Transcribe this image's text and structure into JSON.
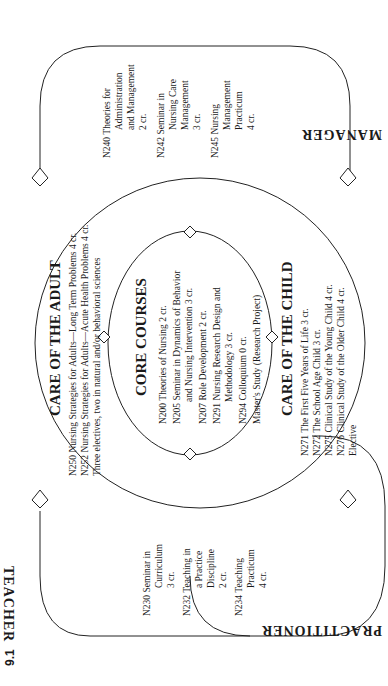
{
  "figure_label": "9.1",
  "roles": {
    "manager": "MANAGER",
    "teacher": "TEACHER",
    "practitioner": "PRACTITIONER"
  },
  "core_courses": {
    "title": "CORE COURSES",
    "items": [
      {
        "code": "N200",
        "lines": [
          "Theories of Nursing 2 cr."
        ]
      },
      {
        "code": "N205",
        "lines": [
          "Seminar in Dynamics of Behavior",
          "and Nursing Intervention 3 cr."
        ]
      },
      {
        "code": "N207",
        "lines": [
          "Role Development 2 cr."
        ]
      },
      {
        "code": "N291",
        "lines": [
          "Nursing Research Design and",
          "Methodology 3 cr."
        ]
      },
      {
        "code": "N294",
        "lines": [
          "Colloquium 0 cr."
        ]
      },
      {
        "code": "",
        "lines": [
          "Master's Study (Research Project)"
        ]
      }
    ]
  },
  "care_of_adult": {
    "title": "CARE OF THE ADULT",
    "items": [
      {
        "code": "N250",
        "lines": [
          "Nursing Strategies for Adults—Long Term Problems 4 cr."
        ]
      },
      {
        "code": "N252",
        "lines": [
          "Nursing Strategies for Adults—Acute Health Problems 4 cr."
        ]
      },
      {
        "code": "",
        "lines": [
          "Three electives, two in natural and/or behavioral sciences"
        ]
      }
    ]
  },
  "care_of_child": {
    "title": "CARE OF THE CHILD",
    "items": [
      {
        "code": "N271",
        "lines": [
          "The First Five Years of Life 3 cr."
        ]
      },
      {
        "code": "N272",
        "lines": [
          "The School Age Child 3 cr."
        ]
      },
      {
        "code": "N275",
        "lines": [
          "Clinical Study of the Young Child 4 cr."
        ]
      },
      {
        "code": "N276",
        "lines": [
          "Clinical Study of the Older Child 4 cr."
        ]
      },
      {
        "code": "",
        "lines": [
          "Elective"
        ]
      }
    ]
  },
  "manager_track": {
    "items": [
      {
        "code": "N240",
        "lines": [
          "Theories for",
          "Administration",
          "and Management",
          "2 cr."
        ]
      },
      {
        "code": "N242",
        "lines": [
          "Seminar in",
          "Nursing Care",
          "Management",
          "3 cr."
        ]
      },
      {
        "code": "N245",
        "lines": [
          "Nursing",
          "Management",
          "Practicum",
          "4 cr."
        ]
      }
    ]
  },
  "teacher_track": {
    "items": [
      {
        "code": "N230",
        "lines": [
          "Seminar in",
          "Curriculum",
          "3 cr."
        ]
      },
      {
        "code": "N232",
        "lines": [
          "Teaching in",
          "a Practice",
          "Discipline",
          "2 cr."
        ]
      },
      {
        "code": "N234",
        "lines": [
          "Teaching",
          "Practicum",
          "4 cr."
        ]
      }
    ]
  }
}
